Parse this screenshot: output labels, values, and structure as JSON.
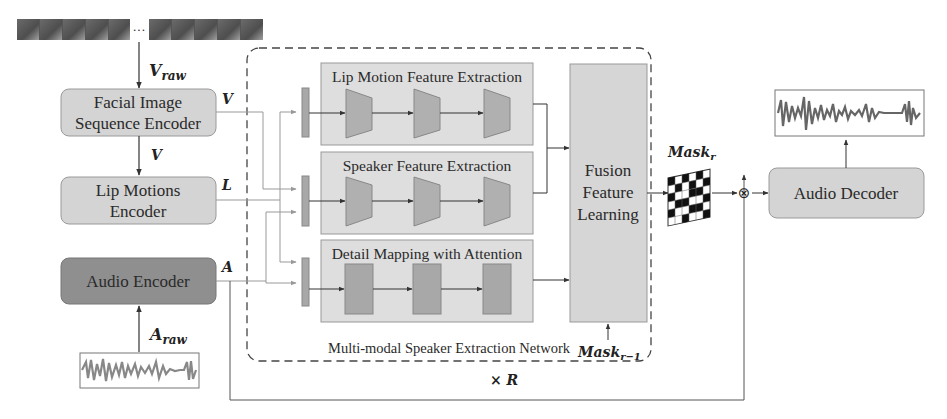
{
  "figure": {
    "inputs": {
      "video_frames": {
        "ellipsis": "···",
        "label_main": "V",
        "label_sub": "raw"
      },
      "audio_waveform": {
        "label_main": "A",
        "label_sub": "raw"
      }
    },
    "encoders": {
      "facial": {
        "line1": "Facial Image",
        "line2": "Sequence Encoder",
        "output": "V"
      },
      "lip": {
        "line1": "Lip Motions",
        "line2": "Encoder",
        "output": "L",
        "input": "V"
      },
      "audio": {
        "line1": "Audio Encoder",
        "output": "A"
      }
    },
    "network": {
      "title": "Multi-modal Speaker Extraction Network",
      "repeat": "× R",
      "branches": [
        {
          "title": "Lip Motion Feature Extraction",
          "block_shape": "trapezoid"
        },
        {
          "title": "Speaker Feature Extraction",
          "block_shape": "trapezoid"
        },
        {
          "title": "Detail Mapping with Attention",
          "block_shape": "rectangle"
        }
      ],
      "fusion": {
        "line1": "Fusion",
        "line2": "Feature",
        "line3": "Learning"
      },
      "mask_prev": {
        "main": "Mask",
        "sub": "r−1"
      }
    },
    "mask_out": {
      "main": "Mask",
      "sub": "r"
    },
    "multiply_symbol": "⊗",
    "decoder": {
      "label": "Audio Decoder"
    }
  },
  "colors": {
    "light_box": "#d9d9d9",
    "mid_box": "#b4b4b4",
    "dark_box": "#8f8f8f",
    "line": "#333333",
    "dashed": "#444444"
  }
}
